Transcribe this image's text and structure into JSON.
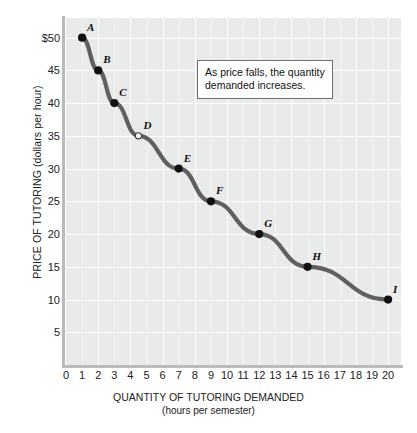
{
  "chart_data": {
    "type": "line",
    "title": "",
    "xlabel": "QUANTITY OF TUTORING DEMANDED",
    "xlabel_sub": "(hours per semester)",
    "ylabel": "PRICE OF TUTORING (dollars per hour)",
    "xlim": [
      0,
      20.8
    ],
    "ylim": [
      0,
      53
    ],
    "grid": true,
    "legend": "none",
    "xticks": [
      "0",
      "1",
      "2",
      "3",
      "4",
      "5",
      "6",
      "7",
      "8",
      "9",
      "10",
      "11",
      "12",
      "13",
      "14",
      "15",
      "16",
      "17",
      "18",
      "19",
      "20"
    ],
    "xtick_values": [
      0,
      1,
      2,
      3,
      4,
      5,
      6,
      7,
      8,
      9,
      10,
      11,
      12,
      13,
      14,
      15,
      16,
      17,
      18,
      19,
      20
    ],
    "yticks": [
      "$50",
      "45",
      "40",
      "35",
      "30",
      "25",
      "20",
      "15",
      "10",
      "5"
    ],
    "ytick_values": [
      50,
      45,
      40,
      35,
      30,
      25,
      20,
      15,
      10,
      5
    ],
    "series": [
      {
        "name": "Demand",
        "color": "#5f6062",
        "points": [
          {
            "label": "A",
            "x": 1,
            "y": 50,
            "marker": "filled"
          },
          {
            "label": "B",
            "x": 2,
            "y": 45,
            "marker": "filled"
          },
          {
            "label": "C",
            "x": 3,
            "y": 40,
            "marker": "filled"
          },
          {
            "label": "D",
            "x": 4.5,
            "y": 35,
            "marker": "open"
          },
          {
            "label": "E",
            "x": 7,
            "y": 30,
            "marker": "filled"
          },
          {
            "label": "F",
            "x": 9,
            "y": 25,
            "marker": "filled"
          },
          {
            "label": "G",
            "x": 12,
            "y": 20,
            "marker": "filled"
          },
          {
            "label": "H",
            "x": 15,
            "y": 15,
            "marker": "filled"
          },
          {
            "label": "I",
            "x": 20,
            "y": 10,
            "marker": "filled"
          }
        ]
      }
    ],
    "annotations": [
      {
        "text": "As price falls, the quantity demanded increases."
      }
    ]
  },
  "annotation": {
    "line1": "As price falls, the quantity",
    "line2": "demanded increases."
  },
  "axes": {
    "x_title": "QUANTITY OF TUTORING DEMANDED",
    "x_subtitle": "(hours per semester)",
    "y_title": "PRICE OF TUTORING (dollars per hour)"
  },
  "colors": {
    "curve": "#5f6062",
    "plot_background": "#e9eaea",
    "gridline": "#ffffff",
    "axis": "#b9babb"
  }
}
